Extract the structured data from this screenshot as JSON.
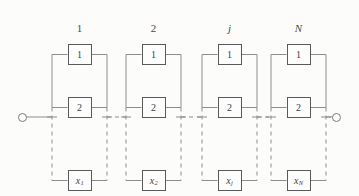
{
  "diagram": {
    "line_color": "#8d8d8d",
    "box_border_color": "#5a5a5a",
    "background": "#fcfcfb",
    "terminals": {
      "left": "input-terminal",
      "right": "output-terminal",
      "symbol": "open-circle"
    },
    "columns": [
      {
        "label": "1",
        "italic": false,
        "rail_left": 52,
        "rail_right": 107,
        "blocks": [
          {
            "text": "1",
            "sub": "",
            "italic": false
          },
          {
            "text": "2",
            "sub": "",
            "italic": false
          },
          {
            "text": "x",
            "sub": "1",
            "italic": true
          }
        ]
      },
      {
        "label": "2",
        "italic": false,
        "rail_left": 126,
        "rail_right": 181,
        "blocks": [
          {
            "text": "1",
            "sub": "",
            "italic": false
          },
          {
            "text": "2",
            "sub": "",
            "italic": false
          },
          {
            "text": "x",
            "sub": "2",
            "italic": true
          }
        ]
      },
      {
        "label": "j",
        "italic": true,
        "rail_left": 202,
        "rail_right": 257,
        "blocks": [
          {
            "text": "1",
            "sub": "",
            "italic": false
          },
          {
            "text": "2",
            "sub": "",
            "italic": false
          },
          {
            "text": "x",
            "sub": "j",
            "italic": true
          }
        ]
      },
      {
        "label": "N",
        "italic": true,
        "rail_left": 271,
        "rail_right": 326,
        "blocks": [
          {
            "text": "1",
            "sub": "",
            "italic": false
          },
          {
            "text": "2",
            "sub": "",
            "italic": false
          },
          {
            "text": "x",
            "sub": "N",
            "italic": true
          }
        ]
      }
    ],
    "rows": {
      "label_y": 22,
      "block1_y": 44,
      "block2_y": 97,
      "mid_y": 117,
      "blockn_y": 170
    }
  }
}
